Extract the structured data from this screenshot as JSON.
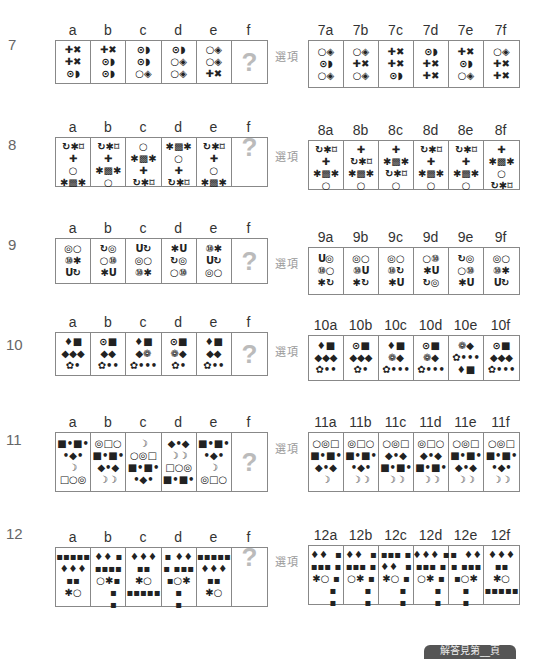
{
  "option_label": "選項",
  "missing_mark": "?",
  "footer_badge": "解答見第__頁",
  "questions": [
    {
      "number": "7",
      "headers": [
        "a",
        "b",
        "c",
        "d",
        "e",
        "f"
      ],
      "cells": [
        [
          "✚✖",
          "✚✖",
          "⊙◗"
        ],
        [
          "✚✖",
          "⊙◗",
          "⊙◗"
        ],
        [
          "⊙◗",
          "⊙◗",
          "○◈"
        ],
        [
          "⊙◗",
          "○◈",
          "○◈"
        ],
        [
          "○◈",
          "○◈",
          "✚✖"
        ],
        [
          "?"
        ]
      ],
      "option_headers": [
        "7a",
        "7b",
        "7c",
        "7d",
        "7e",
        "7f"
      ],
      "options": [
        [
          "○◈",
          "⊙◗",
          "○◈"
        ],
        [
          "○◈",
          "✚✖",
          "○◈"
        ],
        [
          "✚✖",
          "✚✖",
          "⊙◗"
        ],
        [
          "⊙◗",
          "✚✖",
          "✚✖"
        ],
        [
          "✚✖",
          "⊙◗",
          "○◈"
        ],
        [
          "○◈",
          "✚✖",
          "✚✖"
        ]
      ]
    },
    {
      "number": "8",
      "headers": [
        "a",
        "b",
        "c",
        "d",
        "e",
        "f"
      ],
      "cells": [
        [
          "↻✱⌑",
          "✚",
          "○",
          "✱▩✱"
        ],
        [
          "↻✱⌑",
          "✚",
          "✱▩✱",
          "○"
        ],
        [
          "○",
          "✱▩✱",
          "✚",
          "↻✱⌑"
        ],
        [
          "✱▩✱",
          "○",
          "✚",
          "↻✱⌑"
        ],
        [
          "↻✱⌑",
          "✚",
          "○",
          "✱▩✱"
        ],
        [
          "?"
        ]
      ],
      "option_headers": [
        "8a",
        "8b",
        "8c",
        "8d",
        "8e",
        "8f"
      ],
      "options": [
        [
          "↻✱⌑",
          "✚",
          "✱▩✱",
          "○"
        ],
        [
          "✚",
          "↻✱⌑",
          "✱▩✱",
          "○"
        ],
        [
          "✚",
          "✱▩✱",
          "↻✱⌑",
          "○"
        ],
        [
          "↻✱⌑",
          "✚",
          "✱▩✱",
          "○"
        ],
        [
          "↻✱⌑",
          "✚",
          "✱▩✱",
          "○"
        ],
        [
          "✚",
          "✱▩✱",
          "○",
          "↻✱⌑"
        ]
      ]
    },
    {
      "number": "9",
      "headers": [
        "a",
        "b",
        "c",
        "d",
        "e",
        "f"
      ],
      "cells": [
        [
          "◎○",
          "⑩✱",
          "Ս↻"
        ],
        [
          "↻◎",
          "○⑩",
          "✱Ս"
        ],
        [
          "Ս↻",
          "◎○",
          "⑩✱"
        ],
        [
          "✱Ս",
          "↻◎",
          "○⑩"
        ],
        [
          "⑩✱",
          "Ս↻",
          "◎○"
        ],
        [
          "?"
        ]
      ],
      "option_headers": [
        "9a",
        "9b",
        "9c",
        "9d",
        "9e",
        "9f"
      ],
      "options": [
        [
          "Ս◎",
          "⑩○",
          "✱↻"
        ],
        [
          "◎○",
          "⑩Ս",
          "✱↻"
        ],
        [
          "◎○",
          "⑩↻",
          "✱Ս"
        ],
        [
          "○⑩",
          "✱Ս",
          "↻◎"
        ],
        [
          "↻◎",
          "○⑩",
          "✱Ս"
        ],
        [
          "◎○",
          "⑩✱",
          "Ս↻"
        ]
      ]
    },
    {
      "number": "10",
      "headers": [
        "a",
        "b",
        "c",
        "d",
        "e",
        "f"
      ],
      "cells": [
        [
          "♦■",
          "◆◆◆",
          "✿•"
        ],
        [
          "⊙■",
          "◆◆",
          "✿••"
        ],
        [
          "♦■",
          "◆❁",
          "✿•••"
        ],
        [
          "⊙■",
          "❁◆",
          "✿•"
        ],
        [
          "♦■",
          "◆◆",
          "✿••"
        ],
        [
          "?"
        ]
      ],
      "option_headers": [
        "10a",
        "10b",
        "10c",
        "10d",
        "10e",
        "10f"
      ],
      "options": [
        [
          "♦■",
          "◆◆◆",
          "✿••"
        ],
        [
          "⊙■",
          "◆◆◆",
          "✿•"
        ],
        [
          "♦■",
          "❁◆",
          "✿•••"
        ],
        [
          "⊙■",
          "❁◆",
          "✿•••"
        ],
        [
          "❁◆",
          "✿•••",
          "♦■"
        ],
        [
          "⊙■",
          "◆◆◆",
          "✿•••"
        ]
      ]
    },
    {
      "number": "11",
      "headers": [
        "a",
        "b",
        "c",
        "d",
        "e",
        "f"
      ],
      "cells": [
        [
          "■•■•",
          "•◆•",
          "☽",
          "□○◎"
        ],
        [
          "◎□○",
          "■•■•",
          "◆•◆",
          "☽☽"
        ],
        [
          "☽",
          "○◎□",
          "■•■•",
          "•◆•"
        ],
        [
          "◆•◆",
          "☽☽",
          "□○◎",
          "■•■•"
        ],
        [
          "■•■•",
          "•◆•",
          "☽",
          "◎□○"
        ],
        [
          "?"
        ]
      ],
      "option_headers": [
        "11a",
        "11b",
        "11c",
        "11d",
        "11e",
        "11f"
      ],
      "options": [
        [
          "○◎□",
          "■•■•",
          "◆•◆",
          "☽"
        ],
        [
          "◎□○",
          "■•■•",
          "•◆•",
          "☽☽"
        ],
        [
          "○◎□",
          "◆•◆",
          "■•■•",
          "☽☽"
        ],
        [
          "◎□○",
          "◆•◆",
          "■•■•",
          "☽☽"
        ],
        [
          "○◎□",
          "■•■•",
          "◆•◆",
          "☽☽"
        ],
        [
          "○◎□",
          "■•■•",
          "•◆•",
          "☽☽"
        ]
      ]
    },
    {
      "number": "12",
      "headers": [
        "a",
        "b",
        "c",
        "d",
        "e",
        "f"
      ],
      "cells": [
        [
          "▪▪▪▪▪",
          "♦♦♦",
          "▪▪",
          "✱○"
        ],
        [
          "♦♦ ▪",
          "▪▪▪▪",
          "○✱▪",
          "   ▪",
          "   ▪"
        ],
        [
          "",
          "♦♦♦",
          "▪▪",
          "✱○",
          "▪▪▪▪▪"
        ],
        [
          "▪ ♦♦",
          "▪ ▪▪▪",
          "▪○✱",
          "▪",
          "▪"
        ],
        [
          "▪▪▪▪▪",
          "♦♦♦",
          "▪▪",
          "✱○"
        ],
        [
          "?"
        ]
      ],
      "option_headers": [
        "12a",
        "12b",
        "12c",
        "12d",
        "12e",
        "12f"
      ],
      "options": [
        [
          "♦♦  ▪",
          "▪▪▪ ▪",
          "✱○ ▪",
          "    ▪",
          "    ▪"
        ],
        [
          "♦♦  ▪",
          "▪▪▪ ▪",
          "○✱ ▪",
          "    ▪",
          "    ▪"
        ],
        [
          "▪▪▪ ▪",
          "♦♦  ▪",
          "✱○ ▪",
          "    ▪",
          "    ▪"
        ],
        [
          "♦♦♦ ▪",
          "▪▪▪ ▪",
          "○✱ ▪",
          "    ▪",
          "    ▪"
        ],
        [
          "▪  ♦♦",
          "▪ ▪▪▪",
          "▪○✱",
          "▪",
          "▪"
        ],
        [
          "",
          "♦♦♦",
          "▪▪",
          "✱○",
          "▪▪▪▪▪"
        ]
      ]
    }
  ]
}
